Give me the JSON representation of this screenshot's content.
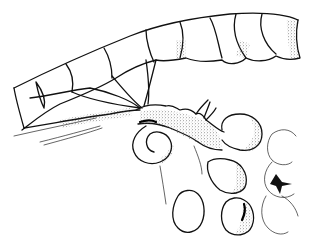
{
  "illustration": {
    "subject": "segmented filament with branching hypha and globular swollen cells",
    "style": "black ink line drawing with stippled shading",
    "colors": {
      "ink": "#111111",
      "background": "#ffffff"
    }
  }
}
